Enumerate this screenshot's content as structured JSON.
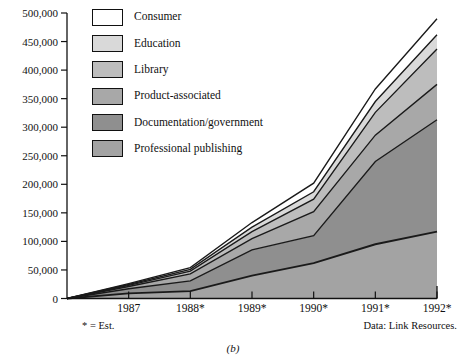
{
  "figure": {
    "panel_label": "(b)",
    "footnote_left": "* = Est.",
    "footnote_right": "Data:  Link Resources."
  },
  "legend": {
    "items": [
      {
        "label": "Consumer",
        "color": "#ffffff"
      },
      {
        "label": "Education",
        "color": "#d9d9d9"
      },
      {
        "label": "Library",
        "color": "#bdbdbd"
      },
      {
        "label": "Product-associated",
        "color": "#a8a8a8"
      },
      {
        "label": "Documentation/government",
        "color": "#8f8f8f"
      },
      {
        "label": "Professional publishing",
        "color": "#a3a3a3"
      }
    ]
  },
  "axes": {
    "y_ticks": [
      "0",
      "50,000",
      "100,000",
      "150,000",
      "200,000",
      "250,000",
      "300,000",
      "350,000",
      "400,000",
      "450,000",
      "500,000"
    ],
    "x_ticks": [
      "1987",
      "1988*",
      "1989*",
      "1990*",
      "1991*",
      "1992*"
    ]
  },
  "chart_data": {
    "type": "area",
    "title": "",
    "subtitle": "",
    "xlabel": "",
    "ylabel": "",
    "stacked": true,
    "grid": false,
    "legend_position": "inside-top-left",
    "ylim": [
      0,
      500000
    ],
    "y_tick_values": [
      0,
      50000,
      100000,
      150000,
      200000,
      250000,
      300000,
      350000,
      400000,
      450000,
      500000
    ],
    "x": [
      "1986",
      "1987",
      "1988*",
      "1989*",
      "1990*",
      "1991*",
      "1992*"
    ],
    "x_note": "leftmost origin point is unlabeled (series start at zero)",
    "series": [
      {
        "name": "Professional publishing",
        "color": "#a3a3a3",
        "values": [
          0,
          9000,
          13000,
          40000,
          62000,
          95000,
          117000
        ]
      },
      {
        "name": "Documentation/government",
        "color": "#8f8f8f",
        "values": [
          0,
          8000,
          18000,
          45000,
          48000,
          145000,
          196000
        ]
      },
      {
        "name": "Product-associated",
        "color": "#a8a8a8",
        "values": [
          0,
          4000,
          12000,
          20000,
          42000,
          46000,
          62000
        ]
      },
      {
        "name": "Library",
        "color": "#bdbdbd",
        "values": [
          0,
          2000,
          5000,
          12000,
          22000,
          40000,
          62000
        ]
      },
      {
        "name": "Education",
        "color": "#d9d9d9",
        "values": [
          0,
          1500,
          3000,
          8000,
          13000,
          19000,
          25000
        ]
      },
      {
        "name": "Consumer",
        "color": "#ffffff",
        "values": [
          0,
          1500,
          3000,
          8000,
          15000,
          22000,
          28000
        ]
      }
    ],
    "cumulative_tops": {
      "Professional publishing": [
        0,
        9000,
        13000,
        40000,
        62000,
        95000,
        117000
      ],
      "Documentation/government": [
        0,
        17000,
        31000,
        85000,
        110000,
        240000,
        313000
      ],
      "Product-associated": [
        0,
        21000,
        43000,
        105000,
        152000,
        286000,
        375000
      ],
      "Library": [
        0,
        23000,
        48000,
        117000,
        174000,
        326000,
        437000
      ],
      "Education": [
        0,
        24500,
        51000,
        125000,
        187000,
        345000,
        462000
      ],
      "Consumer": [
        0,
        26000,
        54000,
        133000,
        202000,
        367000,
        490000
      ]
    },
    "annotations": [
      "* = Est.",
      "Data:  Link Resources.",
      "(b)"
    ]
  }
}
